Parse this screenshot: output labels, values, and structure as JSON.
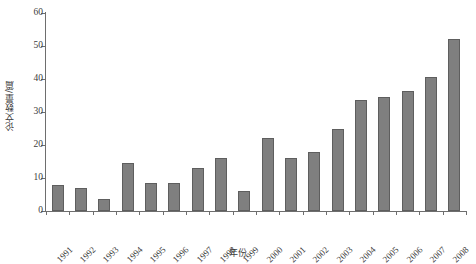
{
  "chart_data": {
    "type": "bar",
    "title": "",
    "xlabel": "年份",
    "ylabel": "论文数量/篇",
    "categories": [
      "1991",
      "1992",
      "1993",
      "1994",
      "1995",
      "1996",
      "1997",
      "1998",
      "1999",
      "2000",
      "2001",
      "2002",
      "2003",
      "2004",
      "2005",
      "2006",
      "2007",
      "2008"
    ],
    "values": [
      8,
      7,
      3.5,
      14.5,
      8.5,
      8.5,
      13,
      16,
      6,
      22,
      16,
      18,
      25,
      33.5,
      34.5,
      36.5,
      40.5,
      52
    ],
    "ylim": [
      0,
      60
    ],
    "yticks": [
      0,
      10,
      20,
      30,
      40,
      50,
      60
    ],
    "ytick_labels": [
      "0",
      "10",
      "20",
      "30",
      "40",
      "50",
      "60"
    ],
    "xlim_categories": 18,
    "grid": false,
    "legend": false,
    "legend_position": "none",
    "bar_color": "#7f7f7f",
    "bar_edge_color": "#5e5e5e",
    "axis_color": "#6e6e6e",
    "background_color": "#ffffff",
    "xtick_label_rotation": -45
  }
}
